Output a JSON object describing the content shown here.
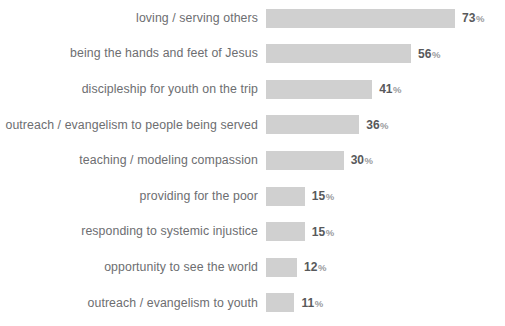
{
  "chart_data": {
    "type": "bar",
    "orientation": "horizontal",
    "title": "",
    "xlabel": "",
    "ylabel": "",
    "grid": false,
    "legend": null,
    "xlim": [
      0,
      73
    ],
    "value_suffix": "%",
    "categories": [
      "loving / serving others",
      "being the hands and feet of Jesus",
      "discipleship for youth on the trip",
      "outreach / evangelism to people being served",
      "teaching / modeling compassion",
      "providing for the poor",
      "responding to systemic injustice",
      "opportunity to see the world",
      "outreach / evangelism to youth"
    ],
    "values": [
      73,
      56,
      41,
      36,
      30,
      15,
      15,
      12,
      11
    ],
    "value_labels": [
      "73",
      "56",
      "41",
      "36",
      "30",
      "15",
      "15",
      "12",
      "11"
    ],
    "bars": [
      {
        "label": "loving / serving others",
        "value": 73,
        "value_text": "73",
        "suffix": "%"
      },
      {
        "label": "being the hands and feet of Jesus",
        "value": 56,
        "value_text": "56",
        "suffix": "%"
      },
      {
        "label": "discipleship for youth on the trip",
        "value": 41,
        "value_text": "41",
        "suffix": "%"
      },
      {
        "label": "outreach / evangelism to people being served",
        "value": 36,
        "value_text": "36",
        "suffix": "%"
      },
      {
        "label": "teaching / modeling compassion",
        "value": 30,
        "value_text": "30",
        "suffix": "%"
      },
      {
        "label": "providing for the poor",
        "value": 15,
        "value_text": "15",
        "suffix": "%"
      },
      {
        "label": "responding to systemic injustice",
        "value": 15,
        "value_text": "15",
        "suffix": "%"
      },
      {
        "label": "opportunity to see the world",
        "value": 12,
        "value_text": "12",
        "suffix": "%"
      },
      {
        "label": "outreach / evangelism to youth",
        "value": 11,
        "value_text": "11",
        "suffix": "%"
      }
    ],
    "colors": {
      "background": "#ffffff",
      "bar_fill": "#d0d0d0",
      "label_text": "#6d6e71",
      "value_text": "#58595b",
      "suffix_text": "#9a9b9e"
    },
    "layout": {
      "bar_start_x": 273,
      "px_per_percent": 2.59,
      "bar_height": 19,
      "row_pitch": 35.6,
      "first_row_top": 5
    }
  }
}
